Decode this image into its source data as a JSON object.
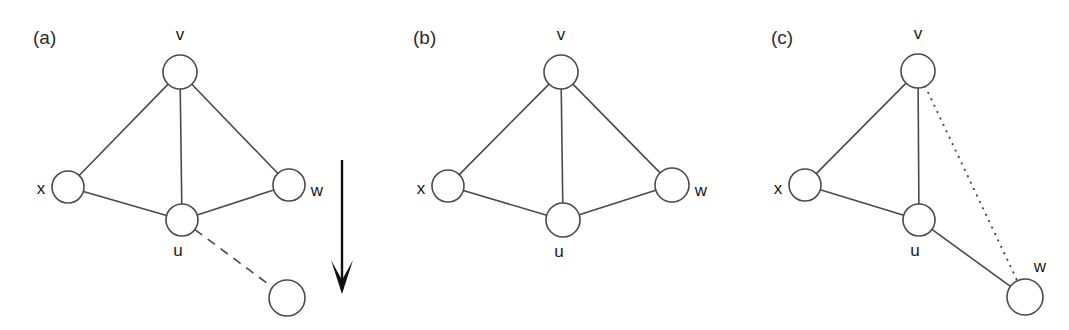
{
  "figure": {
    "type": "graph-diagram",
    "background_color": "#ffffff",
    "stroke_color": "#4a4a4a",
    "text_color": "#1a1a1a",
    "arrow_color": "#111111",
    "caption_font_size": 19,
    "node_font_size": 17
  },
  "panels": [
    {
      "id": "a",
      "label": "(a)",
      "label_pos": {
        "x": 33,
        "y": 44
      },
      "nodes": [
        {
          "name": "v",
          "label": "v",
          "cx": 180,
          "cy": 72,
          "r": 17,
          "label_x": 180,
          "label_y": 40,
          "label_anchor": "middle"
        },
        {
          "name": "x",
          "label": "x",
          "cx": 68,
          "cy": 187,
          "r": 16,
          "label_x": 41,
          "label_y": 194,
          "label_anchor": "middle"
        },
        {
          "name": "w",
          "label": "w",
          "cx": 289,
          "cy": 185,
          "r": 16,
          "label_x": 317,
          "label_y": 196,
          "label_anchor": "middle"
        },
        {
          "name": "u",
          "label": "u",
          "cx": 182,
          "cy": 220,
          "r": 16,
          "label_x": 178,
          "label_y": 256,
          "label_anchor": "middle"
        },
        {
          "name": "new-node",
          "label": "",
          "cx": 287,
          "cy": 298,
          "r": 18,
          "label_x": 287,
          "label_y": 298,
          "label_anchor": "middle"
        }
      ],
      "edges": [
        {
          "from": "v",
          "to": "x",
          "style": "solid"
        },
        {
          "from": "v",
          "to": "u",
          "style": "solid"
        },
        {
          "from": "v",
          "to": "w",
          "style": "solid"
        },
        {
          "from": "x",
          "to": "u",
          "style": "solid"
        },
        {
          "from": "u",
          "to": "w",
          "style": "solid"
        },
        {
          "from": "u",
          "to": "new-node",
          "style": "dashed"
        }
      ],
      "arrow": {
        "x": 342,
        "y_start": 160,
        "y_end": 294,
        "direction": "down"
      }
    },
    {
      "id": "b",
      "label": "(b)",
      "label_pos": {
        "x": 413,
        "y": 44
      },
      "nodes": [
        {
          "name": "v",
          "label": "v",
          "cx": 561,
          "cy": 72,
          "r": 17,
          "label_x": 561,
          "label_y": 40,
          "label_anchor": "middle"
        },
        {
          "name": "x",
          "label": "x",
          "cx": 448,
          "cy": 186,
          "r": 16,
          "label_x": 421,
          "label_y": 194,
          "label_anchor": "middle"
        },
        {
          "name": "w",
          "label": "w",
          "cx": 672,
          "cy": 185,
          "r": 17,
          "label_x": 701,
          "label_y": 196,
          "label_anchor": "middle"
        },
        {
          "name": "u",
          "label": "u",
          "cx": 563,
          "cy": 220,
          "r": 17,
          "label_x": 559,
          "label_y": 257,
          "label_anchor": "middle"
        }
      ],
      "edges": [
        {
          "from": "v",
          "to": "x",
          "style": "solid"
        },
        {
          "from": "v",
          "to": "u",
          "style": "solid"
        },
        {
          "from": "v",
          "to": "w",
          "style": "solid"
        },
        {
          "from": "x",
          "to": "u",
          "style": "solid"
        },
        {
          "from": "u",
          "to": "w",
          "style": "solid"
        }
      ],
      "arrow": null
    },
    {
      "id": "c",
      "label": "(c)",
      "label_pos": {
        "x": 771,
        "y": 44
      },
      "nodes": [
        {
          "name": "v",
          "label": "v",
          "cx": 918,
          "cy": 71,
          "r": 17,
          "label_x": 918,
          "label_y": 39,
          "label_anchor": "middle"
        },
        {
          "name": "x",
          "label": "x",
          "cx": 805,
          "cy": 185,
          "r": 16,
          "label_x": 778,
          "label_y": 194,
          "label_anchor": "middle"
        },
        {
          "name": "u",
          "label": "u",
          "cx": 919,
          "cy": 220,
          "r": 16,
          "label_x": 915,
          "label_y": 256,
          "label_anchor": "middle"
        },
        {
          "name": "w",
          "label": "w",
          "cx": 1025,
          "cy": 297,
          "r": 18,
          "label_x": 1040,
          "label_y": 272,
          "label_anchor": "middle"
        }
      ],
      "edges": [
        {
          "from": "v",
          "to": "x",
          "style": "solid"
        },
        {
          "from": "v",
          "to": "u",
          "style": "solid"
        },
        {
          "from": "x",
          "to": "u",
          "style": "solid"
        },
        {
          "from": "u",
          "to": "w",
          "style": "solid"
        },
        {
          "from": "v",
          "to": "w",
          "style": "dotted"
        }
      ],
      "arrow": null
    }
  ]
}
